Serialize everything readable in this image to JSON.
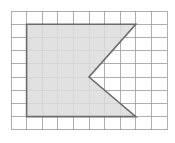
{
  "figure": {
    "background_color": "#ffffff",
    "width": 175,
    "height": 143
  },
  "grid": {
    "name": "square-grid",
    "columns": 10,
    "rows": 9,
    "origin_x": 11,
    "origin_y": 11,
    "cell_width": 15.6,
    "cell_height": 13.2,
    "line_color": "#9a9a9a",
    "line_width": 0.8,
    "x_positions": [
      11,
      26.6,
      42.2,
      57.8,
      73.4,
      89,
      104.6,
      120.2,
      135.8,
      151.4,
      167
    ],
    "y_positions": [
      11,
      24.2,
      37.4,
      50.6,
      63.8,
      77,
      90.2,
      103.4,
      116.6,
      129.8
    ]
  },
  "shape": {
    "name": "shaded-polygon",
    "type": "polygon",
    "description": "Rectangle with a triangular V-notch cut into its right side",
    "fill_color": "#dcdcdc",
    "stroke_color": "#6b6b6b",
    "stroke_width": 1.6,
    "vertex_count": 5,
    "vertices_px": [
      {
        "label": "top-left",
        "x": 26.6,
        "y": 24.2
      },
      {
        "label": "top-right",
        "x": 135.8,
        "y": 24.2
      },
      {
        "label": "notch-vertex",
        "x": 89.0,
        "y": 77.0
      },
      {
        "label": "bottom-right",
        "x": 135.8,
        "y": 116.6
      },
      {
        "label": "bottom-left",
        "x": 26.6,
        "y": 116.6
      }
    ],
    "vertices_grid": [
      {
        "label": "top-left",
        "col": 1,
        "row": 1
      },
      {
        "label": "top-right",
        "col": 8,
        "row": 1
      },
      {
        "label": "notch-vertex",
        "col": 5,
        "row": 5
      },
      {
        "label": "bottom-right",
        "col": 8,
        "row": 8
      },
      {
        "label": "bottom-left",
        "col": 1,
        "row": 8
      }
    ],
    "points_attr": "26.6,24.2 135.8,24.2 89,77 135.8,116.6 26.6,116.6"
  }
}
